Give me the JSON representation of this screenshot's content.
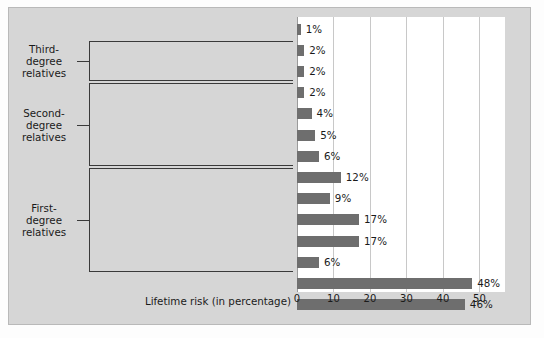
{
  "chart_data": {
    "type": "bar",
    "orientation": "horizontal",
    "title": "",
    "xlabel": "Lifetime risk (in percentage)",
    "ylabel": "",
    "xlim": [
      0,
      57
    ],
    "xticks": [
      0,
      10,
      20,
      30,
      40,
      50
    ],
    "xtick_labels": [
      "0",
      "10",
      "20",
      "30",
      "40",
      "50"
    ],
    "grid": "vertical",
    "legend": "none",
    "bar_color": "#6e6e6e",
    "plot_background": "#ffffff",
    "panel_background": "#d6d6d6",
    "categories": [
      "General population",
      "Spouses of patients",
      "First cousins",
      "Uncles/aunts",
      "Nephews/nieces",
      "Grandchildren",
      "Half-siblings",
      "Children",
      "Siblings",
      "Siblings (with schizophrenic parent)",
      "Dizygotic twins",
      "Parents",
      "Monozygotic twins",
      "Offspring of two schizophrenic parents"
    ],
    "values": [
      1,
      2,
      2,
      2,
      4,
      5,
      6,
      12,
      9,
      17,
      17,
      6,
      48,
      46
    ],
    "value_labels": [
      "1%",
      "2%",
      "2%",
      "2%",
      "4%",
      "5%",
      "6%",
      "12%",
      "9%",
      "17%",
      "17%",
      "6%",
      "48%",
      "46%"
    ],
    "annotations": [
      {
        "label": "Third-\ndegree\nrelatives",
        "label_lines": [
          "Third-",
          "degree",
          "relatives"
        ],
        "covers": [
          "Spouses of patients",
          "First cousins"
        ]
      },
      {
        "label": "Second-\ndegree\nrelatives",
        "label_lines": [
          "Second-",
          "degree",
          "relatives"
        ],
        "covers": [
          "Uncles/aunts",
          "Nephews/nieces",
          "Grandchildren",
          "Half-siblings"
        ]
      },
      {
        "label": "First-\ndegree\nrelatives",
        "label_lines": [
          "First-",
          "degree",
          "relatives"
        ],
        "covers": [
          "Children",
          "Siblings",
          "Siblings (with schizophrenic parent)",
          "Dizygotic twins",
          "Parents"
        ]
      }
    ]
  }
}
